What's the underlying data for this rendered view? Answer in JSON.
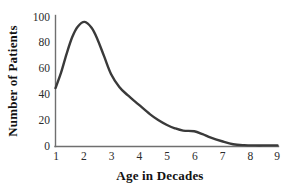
{
  "chart_data": {
    "type": "line",
    "title": "",
    "subtitle": "",
    "xlabel": "Age in Decades",
    "ylabel": "Number of Patients",
    "xlim": [
      1,
      9
    ],
    "ylim": [
      0,
      110
    ],
    "xticks": [
      "1",
      "2",
      "3",
      "4",
      "5",
      "6",
      "7",
      "8",
      "9"
    ],
    "yticks": [
      "0",
      "20",
      "40",
      "60",
      "80",
      "100"
    ],
    "xtick_values": [
      1,
      2,
      3,
      4,
      5,
      6,
      7,
      8,
      9
    ],
    "ytick_values": [
      0,
      20,
      40,
      60,
      80,
      100
    ],
    "grid": false,
    "legend": false,
    "legend_position": "none",
    "series": [
      {
        "name": "Number of Patients",
        "color": "#3a3a3a",
        "x": [
          1.0,
          1.2,
          1.4,
          1.6,
          1.8,
          2.05,
          2.3,
          2.5,
          2.75,
          3.0,
          3.3,
          3.6,
          4.0,
          4.4,
          4.7,
          5.0,
          5.3,
          5.6,
          6.0,
          6.3,
          6.6,
          7.0,
          7.4,
          7.8,
          8.2,
          8.6,
          9.0
        ],
        "y": [
          49,
          62,
          78,
          92,
          101,
          105,
          100,
          91,
          76,
          61,
          50,
          43,
          35,
          27,
          22,
          18,
          15,
          13,
          12.5,
          10,
          7,
          4,
          1.5,
          0.7,
          0.5,
          0.5,
          0.5
        ]
      }
    ],
    "annotations": []
  },
  "axes": {
    "y_axis_label": "Number of Patients",
    "x_axis_label": "Age in Decades"
  },
  "style": {
    "curve_color": "#3a3a3a",
    "axis_color": "#6f6f6f",
    "text_color": "#1a1a1a",
    "background": "#ffffff"
  }
}
